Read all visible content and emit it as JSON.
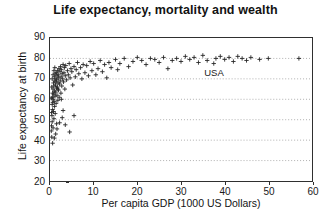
{
  "chart_data": {
    "type": "scatter",
    "title": "Life expectancy, mortality and wealth",
    "xlabel": "Per capita GDP (1000 US Dollars)",
    "ylabel": "Life expectancy at birth",
    "xlim": [
      0,
      60
    ],
    "ylim": [
      20,
      90
    ],
    "xticks": [
      0,
      10,
      20,
      30,
      40,
      50,
      60
    ],
    "yticks": [
      20,
      30,
      40,
      50,
      60,
      70,
      80,
      90
    ],
    "grid": "horizontal-dotted",
    "legend": "none",
    "marker": "plus",
    "marker_color": "#262626",
    "annotations": [
      {
        "label": "USA",
        "x": 37.5,
        "y": 77.5
      }
    ],
    "points": [
      [
        0.3,
        44.5
      ],
      [
        0.35,
        47.0
      ],
      [
        0.4,
        41.5
      ],
      [
        0.45,
        52.0
      ],
      [
        0.5,
        49.0
      ],
      [
        0.5,
        57.5
      ],
      [
        0.55,
        61.0
      ],
      [
        0.6,
        55.0
      ],
      [
        0.6,
        63.0
      ],
      [
        0.65,
        58.5
      ],
      [
        0.7,
        46.0
      ],
      [
        0.7,
        65.0
      ],
      [
        0.75,
        60.0
      ],
      [
        0.8,
        54.0
      ],
      [
        0.8,
        68.0
      ],
      [
        0.85,
        62.5
      ],
      [
        0.9,
        50.5
      ],
      [
        0.9,
        66.5
      ],
      [
        0.95,
        59.0
      ],
      [
        1.0,
        71.0
      ],
      [
        1.0,
        64.0
      ],
      [
        1.05,
        56.5
      ],
      [
        1.1,
        69.0
      ],
      [
        1.15,
        61.5
      ],
      [
        1.2,
        72.5
      ],
      [
        1.2,
        53.0
      ],
      [
        1.25,
        67.0
      ],
      [
        1.3,
        63.5
      ],
      [
        1.35,
        70.0
      ],
      [
        1.4,
        58.0
      ],
      [
        1.45,
        73.0
      ],
      [
        1.5,
        65.5
      ],
      [
        1.5,
        48.0
      ],
      [
        1.55,
        69.5
      ],
      [
        1.6,
        62.0
      ],
      [
        1.65,
        71.5
      ],
      [
        1.7,
        66.0
      ],
      [
        1.75,
        74.0
      ],
      [
        1.8,
        59.5
      ],
      [
        1.85,
        68.0
      ],
      [
        1.9,
        72.0
      ],
      [
        1.95,
        64.5
      ],
      [
        2.0,
        70.5
      ],
      [
        2.05,
        75.0
      ],
      [
        2.1,
        61.0
      ],
      [
        2.2,
        67.5
      ],
      [
        2.3,
        73.5
      ],
      [
        2.35,
        69.0
      ],
      [
        2.4,
        76.0
      ],
      [
        2.5,
        63.0
      ],
      [
        2.55,
        71.0
      ],
      [
        2.6,
        74.5
      ],
      [
        2.7,
        66.5
      ],
      [
        2.8,
        72.5
      ],
      [
        2.9,
        70.0
      ],
      [
        3.0,
        77.0
      ],
      [
        3.1,
        68.5
      ],
      [
        3.2,
        73.0
      ],
      [
        3.3,
        75.5
      ],
      [
        3.4,
        65.0
      ],
      [
        3.5,
        71.5
      ],
      [
        3.6,
        76.5
      ],
      [
        3.8,
        69.5
      ],
      [
        4.0,
        74.0
      ],
      [
        4.2,
        72.0
      ],
      [
        4.4,
        77.5
      ],
      [
        4.6,
        70.5
      ],
      [
        4.8,
        75.0
      ],
      [
        5.0,
        73.5
      ],
      [
        5.2,
        67.0
      ],
      [
        5.5,
        76.0
      ],
      [
        5.8,
        71.0
      ],
      [
        6.0,
        74.5
      ],
      [
        6.3,
        78.0
      ],
      [
        6.6,
        72.5
      ],
      [
        7.0,
        75.5
      ],
      [
        7.3,
        70.0
      ],
      [
        7.6,
        77.0
      ],
      [
        8.0,
        73.0
      ],
      [
        8.4,
        76.5
      ],
      [
        8.8,
        71.5
      ],
      [
        9.2,
        78.5
      ],
      [
        9.6,
        74.0
      ],
      [
        10.0,
        77.5
      ],
      [
        10.5,
        72.0
      ],
      [
        11.0,
        75.0
      ],
      [
        11.5,
        79.0
      ],
      [
        12.0,
        73.5
      ],
      [
        12.5,
        77.0
      ],
      [
        13.0,
        70.5
      ],
      [
        13.5,
        78.0
      ],
      [
        14.0,
        75.5
      ],
      [
        15.0,
        79.5
      ],
      [
        15.5,
        74.5
      ],
      [
        16.0,
        77.5
      ],
      [
        17.0,
        80.0
      ],
      [
        18.0,
        76.0
      ],
      [
        19.0,
        78.5
      ],
      [
        20.0,
        80.5
      ],
      [
        21.0,
        79.0
      ],
      [
        22.0,
        77.0
      ],
      [
        23.0,
        80.0
      ],
      [
        24.0,
        79.5
      ],
      [
        25.0,
        78.0
      ],
      [
        26.0,
        80.5
      ],
      [
        27.0,
        75.0
      ],
      [
        28.0,
        79.0
      ],
      [
        29.0,
        80.0
      ],
      [
        30.0,
        78.5
      ],
      [
        31.0,
        81.0
      ],
      [
        32.0,
        79.5
      ],
      [
        33.0,
        80.5
      ],
      [
        34.0,
        78.0
      ],
      [
        35.0,
        81.5
      ],
      [
        36.0,
        79.0
      ],
      [
        37.5,
        77.5
      ],
      [
        38.0,
        80.0
      ],
      [
        39.0,
        81.0
      ],
      [
        40.0,
        79.5
      ],
      [
        41.0,
        80.5
      ],
      [
        42.0,
        78.5
      ],
      [
        43.0,
        81.0
      ],
      [
        44.0,
        80.0
      ],
      [
        45.0,
        79.0
      ],
      [
        46.0,
        80.5
      ],
      [
        48.0,
        79.5
      ],
      [
        50.0,
        80.0
      ],
      [
        57.0,
        80.0
      ],
      [
        1.0,
        41.0
      ],
      [
        1.6,
        45.5
      ],
      [
        2.2,
        48.5
      ],
      [
        3.5,
        47.5
      ],
      [
        4.5,
        44.0
      ],
      [
        0.6,
        38.5
      ],
      [
        1.3,
        43.0
      ],
      [
        2.8,
        51.0
      ],
      [
        5.5,
        52.0
      ],
      [
        3.0,
        54.5
      ],
      [
        0.4,
        66.0
      ],
      [
        0.5,
        70.0
      ],
      [
        0.7,
        72.0
      ],
      [
        0.9,
        74.0
      ],
      [
        1.1,
        75.5
      ],
      [
        1.4,
        68.5
      ],
      [
        1.8,
        65.0
      ],
      [
        2.6,
        60.0
      ],
      [
        0.3,
        60.5
      ],
      [
        0.35,
        53.5
      ]
    ]
  }
}
